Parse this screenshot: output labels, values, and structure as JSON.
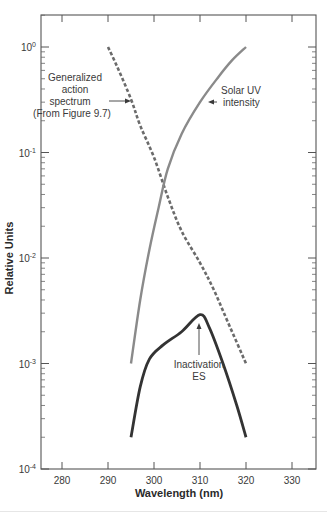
{
  "chart_data": {
    "type": "line",
    "title": "",
    "xlabel": "Wavelength (nm)",
    "ylabel": "Relative Units",
    "xlim": [
      275,
      335
    ],
    "ylim": [
      0.0001,
      3
    ],
    "yscale": "log",
    "grid": false,
    "x_ticks": [
      280,
      290,
      300,
      310,
      320,
      330
    ],
    "y_ticks": [
      {
        "value": 1,
        "label": "10",
        "exp": "0"
      },
      {
        "value": 0.1,
        "label": "10",
        "exp": "-1"
      },
      {
        "value": 0.01,
        "label": "10",
        "exp": "-2"
      },
      {
        "value": 0.001,
        "label": "10",
        "exp": "-3"
      },
      {
        "value": 0.0001,
        "label": "10",
        "exp": "-4"
      }
    ],
    "series": [
      {
        "name": "Generalized action spectrum (From Figure 9.7)",
        "style": "dashed",
        "color": "#6b6b6b",
        "x": [
          290,
          292,
          295,
          297,
          300,
          303,
          306,
          310,
          313,
          316,
          320
        ],
        "values": [
          1.0,
          0.65,
          0.32,
          0.18,
          0.09,
          0.038,
          0.018,
          0.009,
          0.005,
          0.0025,
          0.001
        ]
      },
      {
        "name": "Solar UV intensity",
        "style": "solid",
        "color": "#8a8a8a",
        "x": [
          295,
          297,
          299,
          301,
          303,
          306,
          310,
          314,
          317,
          320
        ],
        "values": [
          0.001,
          0.004,
          0.012,
          0.03,
          0.07,
          0.15,
          0.3,
          0.52,
          0.75,
          1.0
        ]
      },
      {
        "name": "Inactivation ES",
        "style": "solid",
        "color": "#333333",
        "x": [
          295,
          297,
          299,
          302,
          306,
          310,
          312,
          315,
          318,
          320
        ],
        "values": [
          0.0002,
          0.0006,
          0.0011,
          0.0015,
          0.002,
          0.0029,
          0.0022,
          0.001,
          0.0004,
          0.0002
        ]
      }
    ],
    "annotations": [
      {
        "lines": [
          "Generalized",
          "action",
          "spectrum",
          "(From Figure 9.7)"
        ],
        "points_to": "Generalized action spectrum"
      },
      {
        "lines": [
          "Solar UV",
          "intensity"
        ],
        "points_to": "Solar UV intensity"
      },
      {
        "lines": [
          "Inactivation",
          "ES"
        ],
        "points_to": "Inactivation ES"
      }
    ]
  }
}
